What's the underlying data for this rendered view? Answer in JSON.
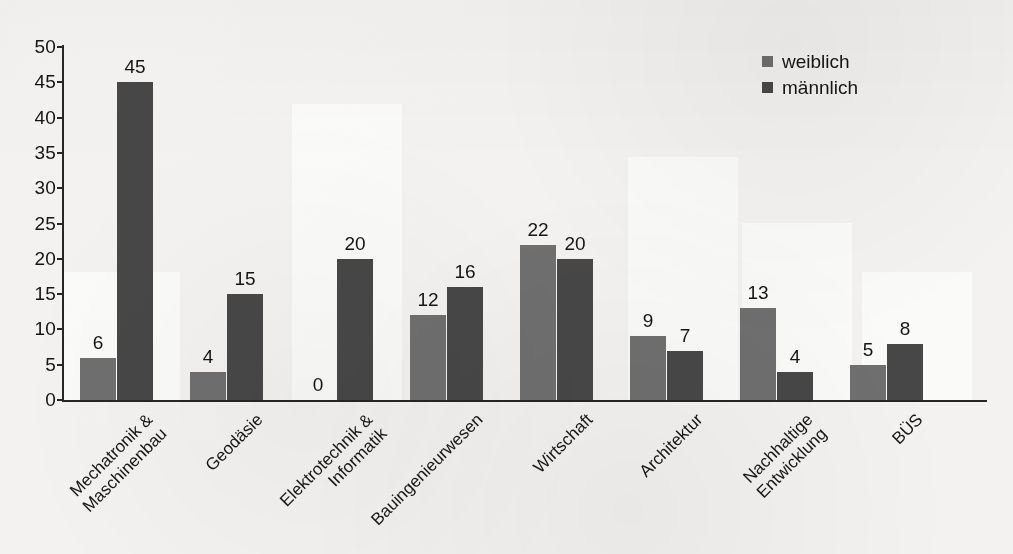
{
  "chart_data": {
    "type": "bar",
    "title": "",
    "xlabel": "",
    "ylabel": "",
    "ylim": [
      0,
      50
    ],
    "ytick_step": 5,
    "yticks": [
      "50",
      "45",
      "40",
      "35",
      "30",
      "25",
      "20",
      "15",
      "10",
      "5",
      "0"
    ],
    "grid": false,
    "legend_position": "top-right",
    "categories": [
      "Mechatronik & Maschinenbau",
      "Geodäsie",
      "Elektrotechnik & Informatik",
      "Bauingenieurwesen",
      "Wirtschaft",
      "Architektur",
      "Nachhaltige Entwicklung",
      "BÜS"
    ],
    "category_lines": [
      [
        "Mechatronik &",
        "Maschinenbau"
      ],
      [
        "Geodäsie"
      ],
      [
        "Elektrotechnik &",
        "Informatik"
      ],
      [
        "Bauingenieurwesen"
      ],
      [
        "Wirtschaft"
      ],
      [
        "Architektur"
      ],
      [
        "Nachhaltige",
        "Entwicklung"
      ],
      [
        "BÜS"
      ]
    ],
    "series": [
      {
        "name": "weiblich",
        "color": "#6f6f6f",
        "values": [
          6,
          4,
          0,
          12,
          22,
          9,
          13,
          5
        ],
        "labels": [
          "6",
          "4",
          "0",
          "12",
          "22",
          "9",
          "13",
          "5"
        ]
      },
      {
        "name": "männlich",
        "color": "#474747",
        "values": [
          45,
          15,
          20,
          16,
          20,
          7,
          4,
          8
        ],
        "labels": [
          "45",
          "15",
          "20",
          "16",
          "20",
          "7",
          "4",
          "8"
        ]
      }
    ]
  },
  "legend": {
    "items": [
      {
        "label": "weiblich",
        "color": "#6f6f6f"
      },
      {
        "label": "männlich",
        "color": "#474747"
      }
    ]
  }
}
